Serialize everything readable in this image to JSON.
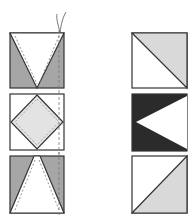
{
  "diagram": {
    "title": "",
    "colors": {
      "light_gray": "#d9d9d9",
      "mid_gray": "#a6a6a6",
      "dark": "#2b2b2b",
      "outline": "#333333",
      "white": "#ffffff",
      "stitch": "#777777"
    },
    "left_column": [
      {
        "id": "left-1",
        "shape": "square with white inverted triangle, gray side triangles, stitch lines, thread tail"
      },
      {
        "id": "left-2",
        "shape": "square with light gray diamond (square on point)"
      },
      {
        "id": "left-3",
        "shape": "square with white upright triangle, gray corners"
      }
    ],
    "right_column": [
      {
        "id": "right-1",
        "shape": "half-square triangle, light gray upper-right"
      },
      {
        "id": "right-2",
        "shape": "dark square with white triangle pointing left"
      },
      {
        "id": "right-3",
        "shape": "half-square triangle, light gray lower-right"
      }
    ]
  }
}
